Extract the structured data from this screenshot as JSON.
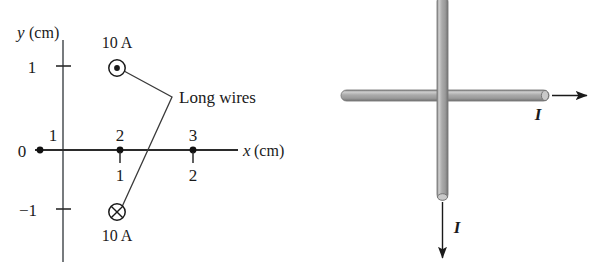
{
  "figure": {
    "background_color": "#ffffff",
    "ink_color": "#1a1a1a",
    "wire_fill_color": "#b3b3b3",
    "wire_edge_color": "#6e6e6e"
  },
  "left_panel": {
    "name": "coordinate-axes-diagram",
    "y_axis": {
      "label_var": "y",
      "label_unit": "(cm)",
      "ticks": [
        {
          "value": "1",
          "position_cm": 1
        },
        {
          "value": "−1",
          "position_cm": -1
        }
      ]
    },
    "x_axis": {
      "label_var": "x",
      "label_unit": "(cm)",
      "origin_label": "0",
      "upper_ticks": [
        "1",
        "2",
        "3"
      ],
      "lower_ticks": [
        "1",
        "2"
      ]
    },
    "wires": [
      {
        "name": "wire-out-of-page",
        "symbol": "circle-dot",
        "current_label": "10 A",
        "direction": "out of page",
        "coords_cm": {
          "x": 2,
          "y": 1
        }
      },
      {
        "name": "wire-into-page",
        "symbol": "circle-cross",
        "current_label": "10 A",
        "direction": "into page",
        "coords_cm": {
          "x": 2,
          "y": -1
        }
      }
    ],
    "annotation": {
      "text": "Long wires"
    }
  },
  "right_panel": {
    "name": "crossed-wires-diagram",
    "wires": [
      {
        "name": "horizontal-wire",
        "orientation": "horizontal",
        "current_label": "I",
        "arrow_direction": "right"
      },
      {
        "name": "vertical-wire",
        "orientation": "vertical",
        "current_label": "I",
        "arrow_direction": "down"
      }
    ]
  }
}
